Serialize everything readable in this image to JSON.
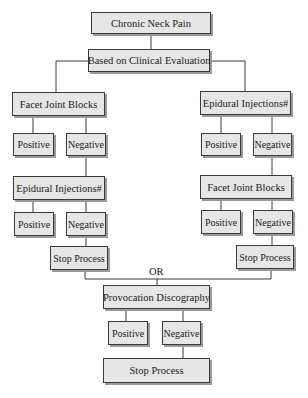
{
  "diagram": {
    "title": "Chronic Neck Pain",
    "evaluation": "Based on Clinical Evaluation",
    "left_branch": {
      "first": "Facet Joint Blocks",
      "first_positive": "Positive",
      "first_negative": "Negative",
      "second": "Epidural Injections#",
      "second_positive": "Positive",
      "second_negative": "Negative",
      "stop": "Stop Process"
    },
    "right_branch": {
      "first": "Epidural Injections#",
      "first_positive": "Positive",
      "first_negative": "Negative",
      "second": "Facet Joint Blocks",
      "second_positive": "Positive",
      "second_negative": "Negative",
      "stop": "Stop Process"
    },
    "join_label": "OR",
    "final": {
      "step": "Provocation Discography",
      "positive": "Positive",
      "negative": "Negative",
      "stop": "Stop Process"
    }
  },
  "colors": {
    "box_fill": "#e6e6e6",
    "border": "#3a3a3a",
    "shadow": "#9a9a9a",
    "line": "#3a3a3a"
  }
}
